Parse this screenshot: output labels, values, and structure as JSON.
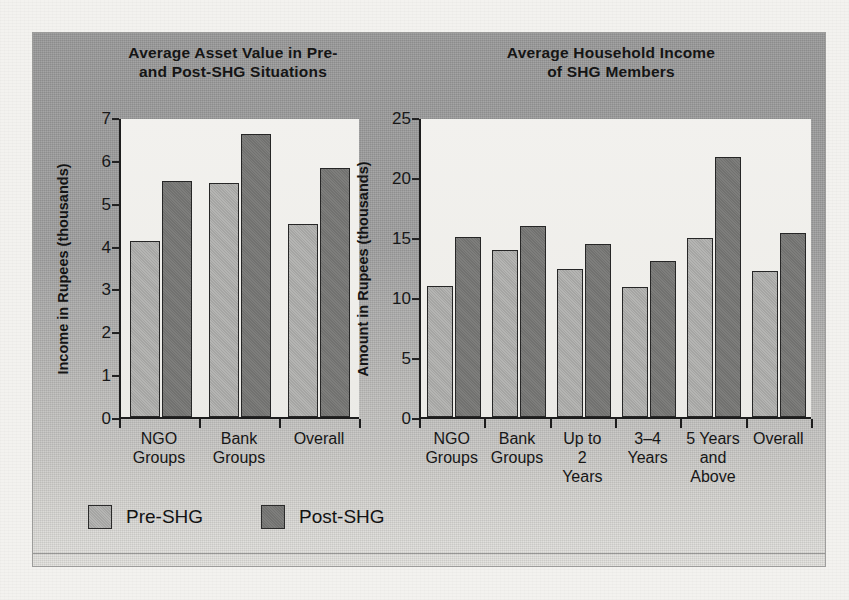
{
  "figure": {
    "legend": [
      {
        "key": "pre",
        "label": "Pre-SHG",
        "color": "#b5b5b3"
      },
      {
        "key": "post",
        "label": "Post-SHG",
        "color": "#7e7e7c"
      }
    ]
  },
  "chart_data": [
    {
      "type": "bar",
      "title": "Average Asset Value in Pre- and Post-SHG Situations",
      "title_line1": "Average Asset Value in Pre-",
      "title_line2": "and Post-SHG Situations",
      "xlabel": "",
      "ylabel": "Income in Rupees (thousands)",
      "ylim": [
        0,
        7
      ],
      "yticks": [
        0,
        1,
        2,
        3,
        4,
        5,
        6,
        7
      ],
      "ytick_labels": [
        "0",
        "1",
        "2",
        "3",
        "4",
        "5",
        "6",
        "7"
      ],
      "grid": false,
      "legend_position": "below-figure",
      "categories": [
        "NGO Groups",
        "Bank Groups",
        "Overall"
      ],
      "category_lines": [
        [
          "NGO",
          "Groups"
        ],
        [
          "Bank",
          "Groups"
        ],
        [
          "Overall"
        ]
      ],
      "series": [
        {
          "name": "Pre-SHG",
          "values": [
            4.1,
            5.45,
            4.5
          ]
        },
        {
          "name": "Post-SHG",
          "values": [
            5.5,
            6.6,
            5.8
          ]
        }
      ]
    },
    {
      "type": "bar",
      "title": "Average Household Income of SHG Members",
      "title_line1": "Average Household Income",
      "title_line2": "of SHG Members",
      "xlabel": "",
      "ylabel": "Amount in Rupees (thousands)",
      "ylim": [
        0,
        25
      ],
      "yticks": [
        0,
        5,
        10,
        15,
        20,
        25
      ],
      "ytick_labels": [
        "0",
        "5",
        "10",
        "15",
        "20",
        "25"
      ],
      "grid": false,
      "legend_position": "below-figure",
      "categories": [
        "NGO Groups",
        "Bank Groups",
        "Up to 2 Years",
        "3–4 Years",
        "5 Years and Above",
        "Overall"
      ],
      "category_lines": [
        [
          "NGO",
          "Groups"
        ],
        [
          "Bank",
          "Groups"
        ],
        [
          "Up to",
          "2",
          "Years"
        ],
        [
          "3–4",
          "Years"
        ],
        [
          "5 Years",
          "and",
          "Above"
        ],
        [
          "Overall"
        ]
      ],
      "series": [
        {
          "name": "Pre-SHG",
          "values": [
            10.9,
            13.9,
            12.3,
            10.8,
            14.9,
            12.2
          ]
        },
        {
          "name": "Post-SHG",
          "values": [
            15.0,
            15.9,
            14.4,
            13.0,
            21.7,
            15.3
          ]
        }
      ]
    }
  ]
}
